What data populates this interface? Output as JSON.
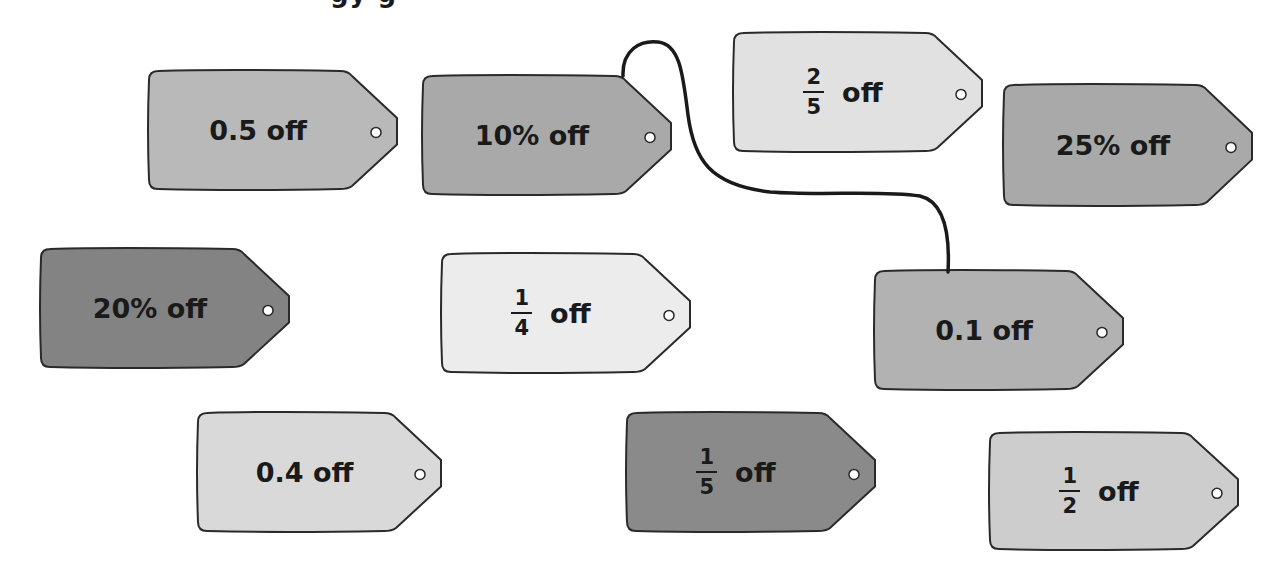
{
  "header": {
    "title_cut_off": "…"
  },
  "tags": [
    {
      "id": "tag-0-5",
      "text": "0.5 off",
      "kind": "text",
      "x": 148,
      "y": 70,
      "w": 250,
      "h": 120,
      "fill": "#b9b9b9"
    },
    {
      "id": "tag-10-percent",
      "text": "10% off",
      "kind": "text",
      "x": 422,
      "y": 75,
      "w": 250,
      "h": 120,
      "fill": "#a9a9a9"
    },
    {
      "id": "tag-2-5",
      "numerator": "2",
      "denominator": "5",
      "suffix": "off",
      "kind": "fraction",
      "x": 733,
      "y": 32,
      "w": 250,
      "h": 120,
      "fill": "#e1e1e1"
    },
    {
      "id": "tag-25-percent",
      "text": "25% off",
      "kind": "text",
      "x": 1003,
      "y": 84,
      "w": 250,
      "h": 122,
      "fill": "#a9a9a9"
    },
    {
      "id": "tag-20-percent",
      "text": "20% off",
      "kind": "text",
      "x": 40,
      "y": 248,
      "w": 250,
      "h": 120,
      "fill": "#838383"
    },
    {
      "id": "tag-1-4",
      "numerator": "1",
      "denominator": "4",
      "suffix": "off",
      "kind": "fraction",
      "x": 441,
      "y": 253,
      "w": 250,
      "h": 120,
      "fill": "#ececec"
    },
    {
      "id": "tag-0-1",
      "text": "0.1 off",
      "kind": "text",
      "x": 874,
      "y": 270,
      "w": 250,
      "h": 120,
      "fill": "#b2b2b2"
    },
    {
      "id": "tag-0-4",
      "text": "0.4 off",
      "kind": "text",
      "x": 197,
      "y": 412,
      "w": 245,
      "h": 120,
      "fill": "#d9d9d9"
    },
    {
      "id": "tag-1-5",
      "numerator": "1",
      "denominator": "5",
      "suffix": "off",
      "kind": "fraction",
      "x": 626,
      "y": 412,
      "w": 250,
      "h": 120,
      "fill": "#8a8a8a"
    },
    {
      "id": "tag-1-2",
      "numerator": "1",
      "denominator": "2",
      "suffix": "off",
      "kind": "fraction",
      "x": 989,
      "y": 432,
      "w": 250,
      "h": 118,
      "fill": "#cdcdcd"
    }
  ],
  "string": {
    "from": "tag-10-percent",
    "to": "tag-0-1",
    "color": "#1a1a1a"
  }
}
